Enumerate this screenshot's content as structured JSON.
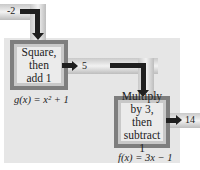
{
  "diagram": {
    "input_value": "-2",
    "box1": {
      "lines": [
        "Square,",
        "then",
        "add 1"
      ]
    },
    "intermediate_value": "5",
    "box1_formula": "g(x) = x² + 1",
    "box2": {
      "lines": [
        "Multiply",
        "by 3, then",
        "subtract 1"
      ]
    },
    "output_value": "14",
    "box2_formula": "f(x) = 3x − 1",
    "colors": {
      "panel": "#e6e6e6",
      "box_border": "#7e7e7e",
      "arrow": "#1f1f1f"
    }
  }
}
